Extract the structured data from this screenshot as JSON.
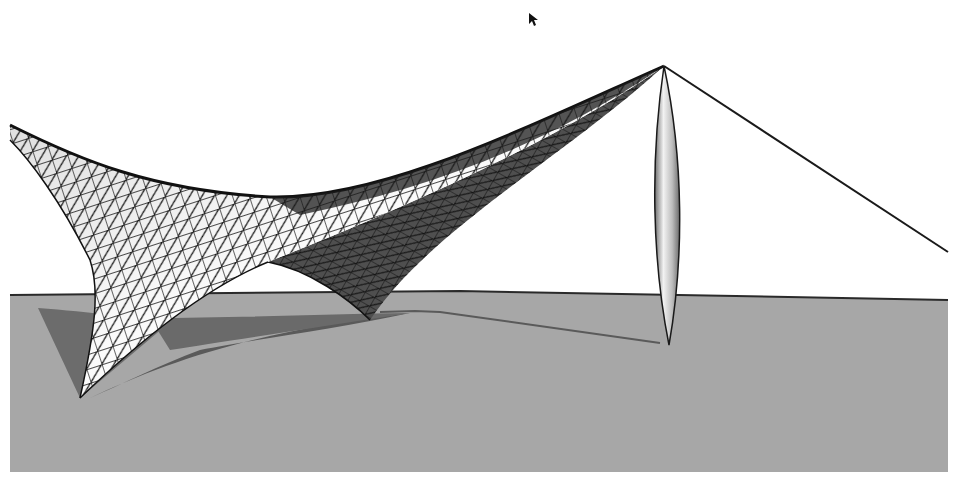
{
  "figure": {
    "colors": {
      "background": "#ffffff",
      "ground": "#a6a6a6",
      "ground_edge": "#2b2b2b",
      "shadow": "#5e5e5e",
      "membrane_light": "#f4f4f4",
      "membrane_dark": "#555555",
      "mesh_lines": "#111111",
      "mast_highlight": "#eeeeee",
      "mast_shade": "#7a7a7a",
      "cable": "#1a1a1a"
    },
    "elements": [
      {
        "name": "ground-plane"
      },
      {
        "name": "membrane-surface",
        "mesh": "triangulated"
      },
      {
        "name": "mast",
        "shape": "lenticular"
      },
      {
        "name": "tension-cable"
      },
      {
        "name": "membrane-shadow"
      },
      {
        "name": "cable-shadow"
      }
    ]
  },
  "caption": {
    "text": "",
    "note": "caption text cut off at bottom edge"
  },
  "cursor": {
    "type": "arrow-pointer"
  }
}
